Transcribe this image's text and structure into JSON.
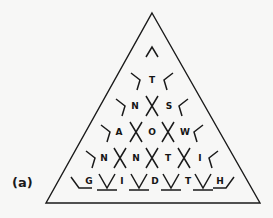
{
  "figure": {
    "panel_label": "(a)",
    "background_color": "#f7f7f6",
    "stroke_color": "#1a1a1a",
    "text_color": "#151515",
    "triangle": {
      "apex": [
        152,
        13
      ],
      "base_left": [
        46,
        203
      ],
      "base_right": [
        260,
        203
      ],
      "stroke_width": 1.4
    },
    "lattice": {
      "description": "triangular lattice of chevron strokes with letters in the gaps",
      "row_count": 6,
      "rows": [
        {
          "index": 0,
          "y": 52,
          "letters": [],
          "marks": [
            "chevron-up"
          ],
          "mark_count": 1
        },
        {
          "index": 1,
          "y": 79,
          "letters": [
            "T"
          ],
          "marks": [
            "chevron-left",
            "chevron-right"
          ],
          "mark_count": 2
        },
        {
          "index": 2,
          "y": 105,
          "letters": [
            "N",
            "S"
          ],
          "marks": [
            "chevron-left",
            "cross",
            "chevron-right"
          ],
          "mark_count": 3
        },
        {
          "index": 3,
          "y": 131,
          "letters": [
            "A",
            "O",
            "W"
          ],
          "marks": [
            "chevron-left",
            "cross",
            "cross",
            "chevron-right"
          ],
          "mark_count": 4
        },
        {
          "index": 4,
          "y": 157,
          "letters": [
            "N",
            "N",
            "T",
            "I"
          ],
          "marks": [
            "chevron-left",
            "cross",
            "cross",
            "cross",
            "chevron-right"
          ],
          "mark_count": 5
        },
        {
          "index": 5,
          "y": 183,
          "letters": [
            "G",
            "I",
            "D",
            "T",
            "H"
          ],
          "marks": [
            "corner-left",
            "chevron-down",
            "chevron-down",
            "chevron-down",
            "chevron-down",
            "corner-right"
          ],
          "mark_count": 6
        }
      ],
      "all_letters_by_row": [
        "",
        "T",
        "N S",
        "A O W",
        "N N T I",
        "G I D T H"
      ],
      "letter_font_size": 9
    }
  }
}
